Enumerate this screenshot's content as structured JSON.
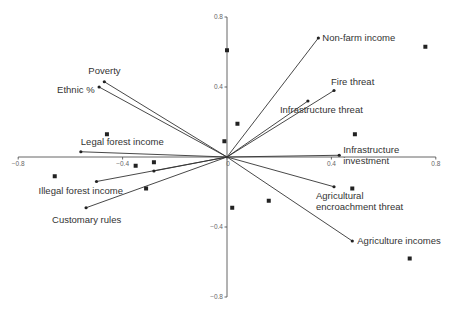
{
  "chart_data": {
    "type": "scatter",
    "subtype": "biplot",
    "title": "",
    "xlabel": "",
    "ylabel": "",
    "xlim": [
      -0.8,
      0.8
    ],
    "ylim": [
      -0.8,
      0.8
    ],
    "grid": false,
    "legend": null,
    "x_ticks": [
      -0.8,
      -0.4,
      0,
      0.4,
      0.8
    ],
    "x_tick_labels": [
      "−0.8",
      "−0.4",
      "0",
      "0.4",
      "0.8"
    ],
    "y_ticks": [
      0.8,
      0.4,
      0,
      -0.4,
      -0.8
    ],
    "y_tick_labels": [
      "0.8",
      "0.4",
      "0",
      "−0.4",
      "−0.8"
    ],
    "vectors": [
      {
        "name": "Non-farm income",
        "x": 0.35,
        "y": 0.68,
        "label": [
          "Non-farm income"
        ],
        "label_dx": 4,
        "label_dy": 3
      },
      {
        "name": "Fire threat",
        "x": 0.41,
        "y": 0.38,
        "label": [
          "Fire threat"
        ],
        "label_dx": -3,
        "label_dy": -6
      },
      {
        "name": "Infrastructure threat",
        "x": 0.31,
        "y": 0.32,
        "label": [
          "Infrastructure threat"
        ],
        "label_dx": -28,
        "label_dy": 12
      },
      {
        "name": "Infrastructure investment",
        "x": 0.43,
        "y": 0.01,
        "label": [
          "Infrastructure",
          "investment"
        ],
        "label_dx": 4,
        "label_dy": -2
      },
      {
        "name": "Agricultural encroachment threat",
        "x": 0.41,
        "y": -0.17,
        "label": [
          "Agricultural",
          "encroachment threat"
        ],
        "label_dx": -18,
        "label_dy": 12
      },
      {
        "name": "Agriculture incomes",
        "x": 0.48,
        "y": -0.48,
        "label": [
          "Agriculture incomes"
        ],
        "label_dx": 5,
        "label_dy": 3
      },
      {
        "name": "Poverty",
        "x": -0.47,
        "y": 0.43,
        "label": [
          "Poverty"
        ],
        "label_dx": -16,
        "label_dy": -8
      },
      {
        "name": "Ethnic %",
        "x": -0.49,
        "y": 0.4,
        "label": [
          "Ethnic %"
        ],
        "label_dx": -42,
        "label_dy": 6
      },
      {
        "name": "Legal forest income",
        "x": -0.56,
        "y": 0.03,
        "label": [
          "Legal forest income"
        ],
        "label_dx": 0,
        "label_dy": -7
      },
      {
        "name": "Illegal forest income",
        "x": -0.5,
        "y": -0.14,
        "label": [
          "Illegal forest income"
        ],
        "label_dx": -58,
        "label_dy": 12
      },
      {
        "name": "Customary rules",
        "x": -0.54,
        "y": -0.29,
        "label": [
          "Customary rules"
        ],
        "label_dx": -34,
        "label_dy": 15
      },
      {
        "name": "",
        "x": -0.28,
        "y": -0.08,
        "label": [],
        "label_dx": 0,
        "label_dy": 0
      }
    ],
    "sites": [
      {
        "x": 0.0,
        "y": 0.61
      },
      {
        "x": 0.76,
        "y": 0.63
      },
      {
        "x": 0.04,
        "y": 0.19
      },
      {
        "x": -0.01,
        "y": 0.09
      },
      {
        "x": -0.46,
        "y": 0.13
      },
      {
        "x": -0.35,
        "y": -0.05
      },
      {
        "x": -0.28,
        "y": -0.03
      },
      {
        "x": -0.31,
        "y": -0.18
      },
      {
        "x": -0.66,
        "y": -0.11
      },
      {
        "x": 0.48,
        "y": -0.18
      },
      {
        "x": 0.16,
        "y": -0.25
      },
      {
        "x": 0.02,
        "y": -0.29
      },
      {
        "x": 0.7,
        "y": -0.58
      },
      {
        "x": 0.49,
        "y": 0.13
      }
    ]
  },
  "layout": {
    "origin_px": [
      227,
      157
    ],
    "x_scale_px_per_unit": 261,
    "y_scale_px_per_unit": 175
  },
  "colors": {
    "axis": "#555555",
    "vector": "#333333",
    "marker": "#222222",
    "text": "#333333",
    "tick_text": "#666666"
  }
}
